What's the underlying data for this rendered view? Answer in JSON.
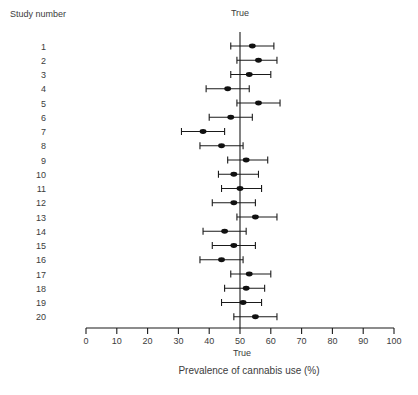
{
  "figure": {
    "left_header": "Study number",
    "top_reference_label": "True",
    "bottom_reference_label": "True",
    "x_axis_label": "Prevalence of cannabis use (%)"
  },
  "colors": {
    "line": "#1a1a1a",
    "marker": "#111111",
    "text": "#3c3c3c"
  },
  "chart_data": {
    "type": "scatter",
    "subtype": "forest-plot",
    "title": "",
    "xlabel": "Prevalence of cannabis use (%)",
    "ylabel": "Study number",
    "xlim": [
      0,
      100
    ],
    "xticks": [
      0,
      10,
      20,
      30,
      40,
      50,
      60,
      70,
      80,
      90,
      100
    ],
    "grid": false,
    "reference_line": {
      "x": 50,
      "label": "True"
    },
    "studies": [
      {
        "study": "1",
        "estimate": 54,
        "ci_low": 47,
        "ci_high": 61
      },
      {
        "study": "2",
        "estimate": 56,
        "ci_low": 49,
        "ci_high": 62
      },
      {
        "study": "3",
        "estimate": 53,
        "ci_low": 47,
        "ci_high": 60
      },
      {
        "study": "4",
        "estimate": 46,
        "ci_low": 39,
        "ci_high": 53
      },
      {
        "study": "5",
        "estimate": 56,
        "ci_low": 49,
        "ci_high": 63
      },
      {
        "study": "6",
        "estimate": 47,
        "ci_low": 40,
        "ci_high": 54
      },
      {
        "study": "7",
        "estimate": 38,
        "ci_low": 31,
        "ci_high": 45
      },
      {
        "study": "8",
        "estimate": 44,
        "ci_low": 37,
        "ci_high": 51
      },
      {
        "study": "9",
        "estimate": 52,
        "ci_low": 46,
        "ci_high": 59
      },
      {
        "study": "10",
        "estimate": 48,
        "ci_low": 43,
        "ci_high": 56
      },
      {
        "study": "11",
        "estimate": 50,
        "ci_low": 44,
        "ci_high": 57
      },
      {
        "study": "12",
        "estimate": 48,
        "ci_low": 41,
        "ci_high": 55
      },
      {
        "study": "13",
        "estimate": 55,
        "ci_low": 49,
        "ci_high": 62
      },
      {
        "study": "14",
        "estimate": 45,
        "ci_low": 38,
        "ci_high": 52
      },
      {
        "study": "15",
        "estimate": 48,
        "ci_low": 41,
        "ci_high": 55
      },
      {
        "study": "16",
        "estimate": 44,
        "ci_low": 37,
        "ci_high": 51
      },
      {
        "study": "17",
        "estimate": 53,
        "ci_low": 47,
        "ci_high": 60
      },
      {
        "study": "18",
        "estimate": 52,
        "ci_low": 45,
        "ci_high": 58
      },
      {
        "study": "19",
        "estimate": 51,
        "ci_low": 44,
        "ci_high": 57
      },
      {
        "study": "20",
        "estimate": 55,
        "ci_low": 48,
        "ci_high": 62
      }
    ]
  }
}
